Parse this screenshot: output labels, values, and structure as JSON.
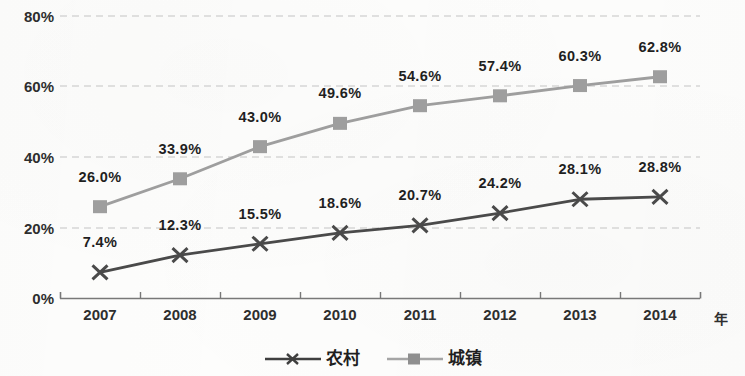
{
  "chart_data": {
    "type": "line",
    "title": "",
    "subtitle": "",
    "xlabel": "年",
    "ylabel": "",
    "categories": [
      "2007",
      "2008",
      "2009",
      "2010",
      "2011",
      "2012",
      "2013",
      "2014"
    ],
    "ylim": [
      0,
      80
    ],
    "ytick_labels": [
      "0%",
      "20%",
      "40%",
      "60%",
      "80%"
    ],
    "ytick_values": [
      0,
      20,
      40,
      60,
      80
    ],
    "grid": "horizontal-dashed",
    "legend_position": "bottom-center",
    "series": [
      {
        "name": "农村",
        "marker": "x",
        "color": "#4a4a4a",
        "values": [
          7.4,
          12.3,
          15.5,
          18.6,
          20.7,
          24.2,
          28.1,
          28.8
        ],
        "labels": [
          "7.4%",
          "12.3%",
          "15.5%",
          "18.6%",
          "20.7%",
          "24.2%",
          "28.1%",
          "28.8%"
        ]
      },
      {
        "name": "城镇",
        "marker": "square",
        "color": "#9e9e9e",
        "values": [
          26.0,
          33.9,
          43.0,
          49.6,
          54.6,
          57.4,
          60.3,
          62.8
        ],
        "labels": [
          "26.0%",
          "33.9%",
          "43.0%",
          "49.6%",
          "54.6%",
          "57.4%",
          "60.3%",
          "62.8%"
        ]
      }
    ]
  },
  "legend": {
    "items": [
      {
        "label": "农村",
        "marker": "x-marker",
        "color": "#4a4a4a"
      },
      {
        "label": "城镇",
        "marker": "square-marker",
        "color": "#9e9e9e"
      }
    ]
  },
  "axes": {
    "x_title": "年",
    "axis_color": "#6f6f6f",
    "gridline_color": "#c9c9c9"
  }
}
